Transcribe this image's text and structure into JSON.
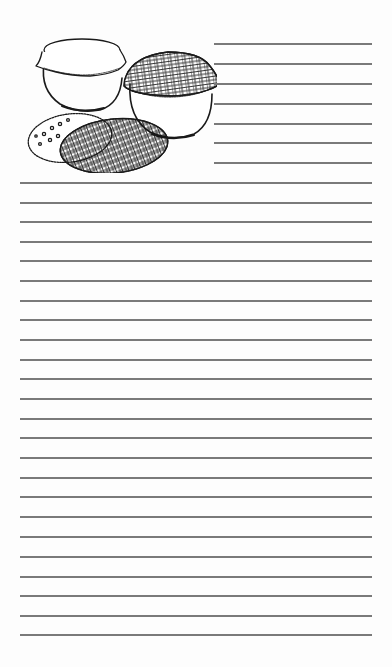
{
  "page": {
    "type": "lined-notepaper",
    "background_color": "#fdfdfd",
    "line_color": "#7a7a7a"
  },
  "illustration": {
    "subject": "bowls-covered-with-cloth",
    "items": [
      "bowl-with-plain-cloth-cover",
      "bowl-with-plaid-cloth-cover",
      "plaid-round-cloth",
      "polka-dot-round-cloth"
    ]
  },
  "short_lines": {
    "x_start": 214,
    "x_end": 372,
    "y_positions": [
      44,
      64,
      84,
      104,
      124,
      143,
      163
    ]
  },
  "long_lines": {
    "x_start": 20,
    "x_end": 372,
    "y_positions": [
      183,
      203,
      222,
      242,
      261,
      281,
      301,
      320,
      340,
      360,
      379,
      399,
      419,
      438,
      458,
      478,
      497,
      517,
      537,
      557,
      577,
      596,
      616,
      635
    ]
  }
}
